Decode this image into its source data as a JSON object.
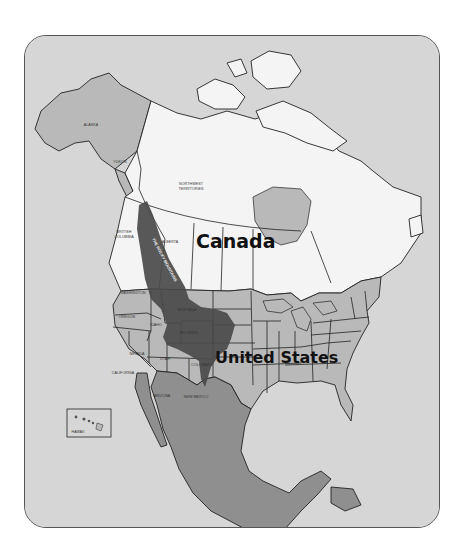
{
  "map": {
    "title": "North America with the Rocky Mountains",
    "countries": [
      {
        "id": "canada",
        "label": "Canada"
      },
      {
        "id": "united-states",
        "label": "United States"
      },
      {
        "id": "mexico",
        "label": ""
      }
    ],
    "feature": {
      "id": "rocky-mountains",
      "label": "THE ROCKY MOUNTAINS"
    },
    "region_labels": {
      "alaska": "ALASKA",
      "yukon": "YUKON",
      "northwest_territories": "NORTHWEST TERRITORIES",
      "northwest_territories_line1": "NORTHWEST",
      "northwest_territories_line2": "TERRITORIES",
      "british_columbia_line1": "BRITISH",
      "british_columbia_line2": "COLUMBIA",
      "alberta": "ALBERTA",
      "washington": "WASHINGTON",
      "oregon": "OREGON",
      "idaho": "IDAHO",
      "montana": "MONTANA",
      "wyoming": "WYOMING",
      "nevada": "NEVADA",
      "utah": "UTAH",
      "colorado": "COLORADO",
      "california": "CALIFORNIA",
      "arizona": "ARIZONA",
      "new_mexico": "NEW MEXICO",
      "hawaii": "HAWAII"
    },
    "colors": {
      "ocean": "#d6d6d6",
      "canada": "#f4f4f4",
      "united_states": "#b9b9b9",
      "mexico": "#8f8f8f",
      "rocky_mountains": "#4a4a4a",
      "frame_border": "#555555"
    }
  }
}
